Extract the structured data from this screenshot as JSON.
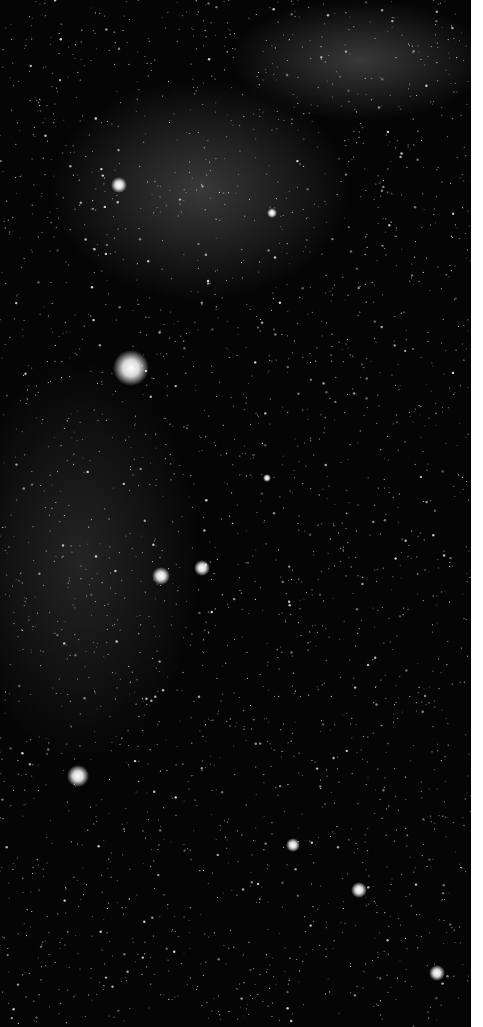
{
  "image": {
    "subject": "star field night sky",
    "background": "#050505",
    "bright_stars": [
      {
        "x": 131,
        "y": 368,
        "r": 18
      },
      {
        "x": 119,
        "y": 185,
        "r": 8
      },
      {
        "x": 161,
        "y": 576,
        "r": 9
      },
      {
        "x": 202,
        "y": 568,
        "r": 8
      },
      {
        "x": 78,
        "y": 776,
        "r": 11
      },
      {
        "x": 293,
        "y": 845,
        "r": 7
      },
      {
        "x": 359,
        "y": 890,
        "r": 8
      },
      {
        "x": 437,
        "y": 973,
        "r": 8
      },
      {
        "x": 272,
        "y": 213,
        "r": 5
      },
      {
        "x": 267,
        "y": 478,
        "r": 4
      }
    ]
  }
}
